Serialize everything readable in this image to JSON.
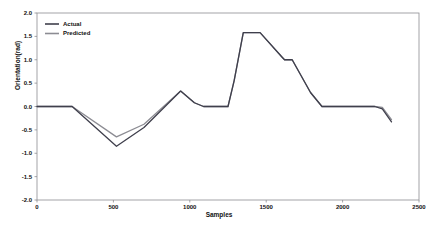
{
  "chart_data": {
    "type": "line",
    "title": "",
    "xlabel": "Samples",
    "ylabel": "Orientation(rad)",
    "xlim": [
      0,
      2500
    ],
    "ylim": [
      -2.0,
      2.0
    ],
    "xticks": [
      "0",
      "500",
      "1000",
      "1500",
      "2000",
      "2500"
    ],
    "xtick_values": [
      0,
      500,
      1000,
      1500,
      2000,
      2500
    ],
    "yticks": [
      "2.0",
      "1.5",
      "1.0",
      "0.5",
      "0.0",
      "-0.5",
      "-1.0",
      "-1.5",
      "-2.0"
    ],
    "ytick_values": [
      2.0,
      1.5,
      1.0,
      0.5,
      0.0,
      -0.5,
      -1.0,
      -1.5,
      -2.0
    ],
    "grid": false,
    "legend_position": "upper-left",
    "series": [
      {
        "name": "Actual",
        "color": "#3f3f4c",
        "x": [
          0,
          230,
          520,
          700,
          940,
          1030,
          1090,
          1250,
          1290,
          1350,
          1460,
          1600,
          1620,
          1670,
          1790,
          1865,
          2210,
          2260,
          2320
        ],
        "values": [
          0.0,
          0.0,
          -0.85,
          -0.45,
          0.33,
          0.08,
          0.0,
          0.0,
          0.55,
          1.58,
          1.58,
          1.07,
          1.0,
          1.0,
          0.3,
          0.0,
          0.0,
          -0.05,
          -0.33
        ]
      },
      {
        "name": "Predicted",
        "color": "#8c8c93",
        "x": [
          0,
          230,
          520,
          700,
          940,
          1030,
          1090,
          1250,
          1290,
          1350,
          1460,
          1600,
          1620,
          1670,
          1790,
          1865,
          2210,
          2260,
          2320
        ],
        "values": [
          0.0,
          0.0,
          -0.65,
          -0.38,
          0.33,
          0.08,
          0.0,
          0.0,
          0.55,
          1.58,
          1.58,
          1.07,
          1.0,
          1.0,
          0.3,
          0.0,
          0.0,
          -0.02,
          -0.28
        ]
      }
    ]
  },
  "legend": {
    "entries": [
      {
        "label": "Actual"
      },
      {
        "label": "Predicted"
      }
    ]
  }
}
